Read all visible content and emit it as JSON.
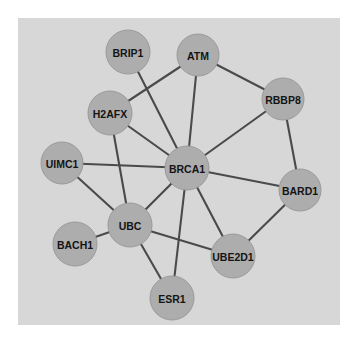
{
  "figure": {
    "panel": {
      "background_color": "#d7d7d7",
      "outer_background_color": "#ffffff",
      "x": 18,
      "y": 18,
      "width": 322,
      "height": 307
    }
  },
  "chart_data": {
    "type": "diagram",
    "subtype": "node-link-network",
    "title": "",
    "node_style": {
      "fill_color": "#adadad",
      "stroke_color": "#9a9a9a",
      "label_color": "#141414",
      "radius": 22
    },
    "edge_style": {
      "color": "#4a4a4a",
      "width": 2.1
    },
    "nodes": [
      {
        "id": "BRIP1",
        "label": "BRIP1",
        "x": 128,
        "y": 52,
        "r": 22
      },
      {
        "id": "ATM",
        "label": "ATM",
        "x": 198,
        "y": 55,
        "r": 21
      },
      {
        "id": "RBBP8",
        "label": "RBBP8",
        "x": 283,
        "y": 99,
        "r": 21
      },
      {
        "id": "H2AFX",
        "label": "H2AFX",
        "x": 110,
        "y": 113,
        "r": 22
      },
      {
        "id": "UIMC1",
        "label": "UIMC1",
        "x": 62,
        "y": 163,
        "r": 21
      },
      {
        "id": "BRCA1",
        "label": "BRCA1",
        "x": 187,
        "y": 168,
        "r": 22
      },
      {
        "id": "BARD1",
        "label": "BARD1",
        "x": 300,
        "y": 190,
        "r": 21
      },
      {
        "id": "UBC",
        "label": "UBC",
        "x": 130,
        "y": 225,
        "r": 22
      },
      {
        "id": "BACH1",
        "label": "BACH1",
        "x": 75,
        "y": 244,
        "r": 22
      },
      {
        "id": "UBE2D1",
        "label": "UBE2D1",
        "x": 233,
        "y": 256,
        "r": 22
      },
      {
        "id": "ESR1",
        "label": "ESR1",
        "x": 172,
        "y": 298,
        "r": 22
      }
    ],
    "edges": [
      {
        "source": "BRIP1",
        "target": "BRCA1"
      },
      {
        "source": "ATM",
        "target": "H2AFX"
      },
      {
        "source": "ATM",
        "target": "BRCA1"
      },
      {
        "source": "ATM",
        "target": "RBBP8"
      },
      {
        "source": "RBBP8",
        "target": "BRCA1"
      },
      {
        "source": "RBBP8",
        "target": "BARD1"
      },
      {
        "source": "H2AFX",
        "target": "BRCA1"
      },
      {
        "source": "H2AFX",
        "target": "UBC"
      },
      {
        "source": "UIMC1",
        "target": "BRCA1"
      },
      {
        "source": "UIMC1",
        "target": "UBC"
      },
      {
        "source": "BRCA1",
        "target": "BARD1"
      },
      {
        "source": "BRCA1",
        "target": "UBC"
      },
      {
        "source": "BRCA1",
        "target": "UBE2D1"
      },
      {
        "source": "BRCA1",
        "target": "ESR1"
      },
      {
        "source": "BARD1",
        "target": "UBE2D1"
      },
      {
        "source": "UBC",
        "target": "BACH1"
      },
      {
        "source": "UBC",
        "target": "UBE2D1"
      },
      {
        "source": "UBC",
        "target": "ESR1"
      }
    ]
  }
}
